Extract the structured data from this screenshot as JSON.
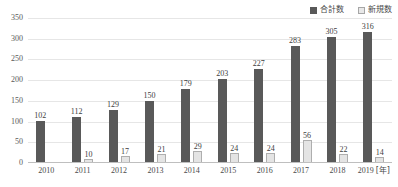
{
  "chart_data": {
    "type": "bar",
    "title": "",
    "xlabel": "年",
    "ylabel": "",
    "ylim": [
      0,
      350
    ],
    "ytick_step": 50,
    "grid": true,
    "legend_position": "top-right",
    "categories": [
      "2010",
      "2011",
      "2012",
      "2013",
      "2014",
      "2015",
      "2016",
      "2017",
      "2018",
      "2019"
    ],
    "series": [
      {
        "name": "合計数",
        "color": "#595959",
        "values": [
          102,
          112,
          129,
          150,
          179,
          203,
          227,
          283,
          305,
          316
        ]
      },
      {
        "name": "新規数",
        "color": "#e4e4e4",
        "values": [
          null,
          10,
          17,
          21,
          29,
          24,
          24,
          56,
          22,
          14
        ]
      }
    ],
    "yticks": [
      "0",
      "50",
      "100",
      "150",
      "200",
      "250",
      "300",
      "350"
    ],
    "x_unit_label": "[年]"
  },
  "legend": {
    "items": [
      {
        "label": "合計数",
        "swatch": "dark-square-icon"
      },
      {
        "label": "新規数",
        "swatch": "light-square-icon"
      }
    ]
  }
}
